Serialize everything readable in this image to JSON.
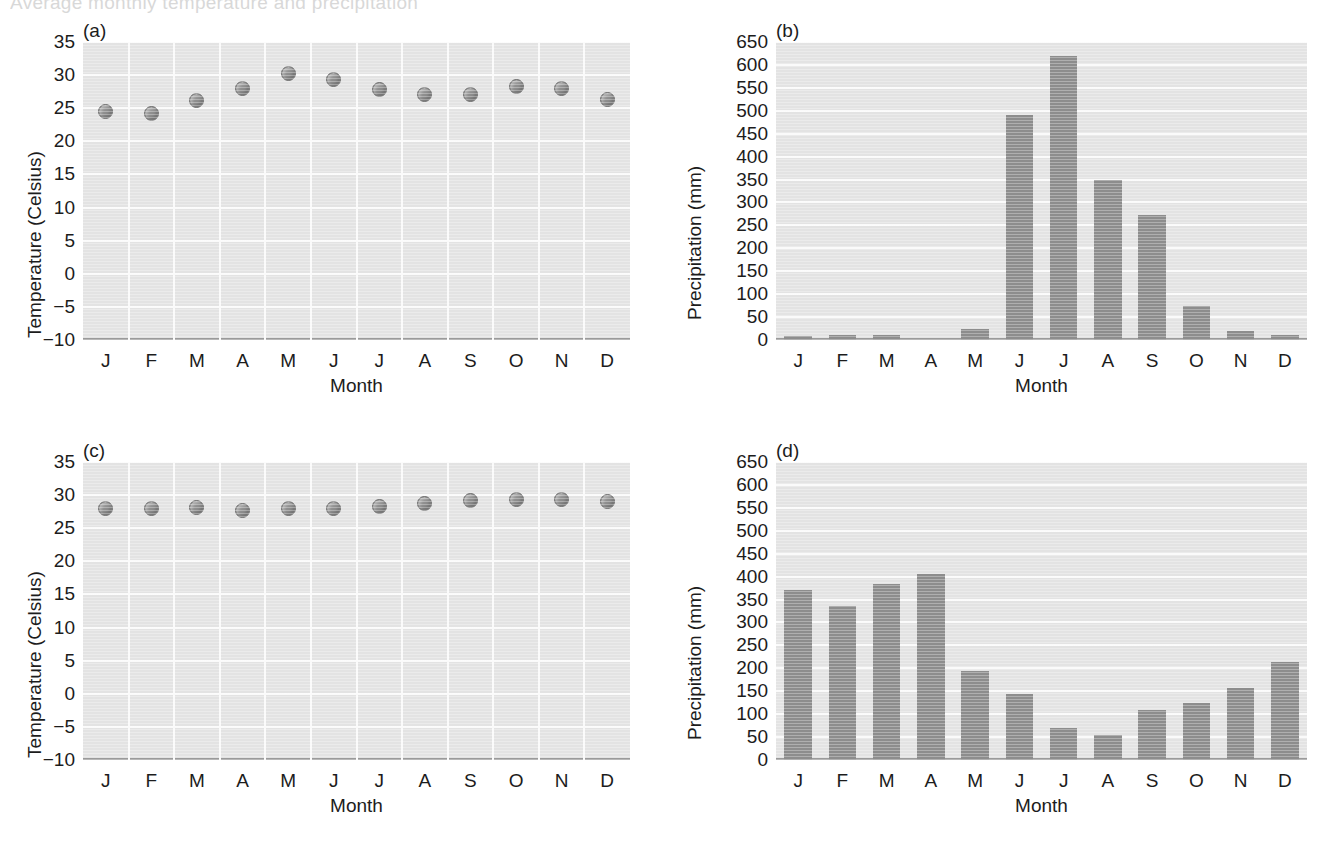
{
  "scan": {
    "top_clipped_text": "Average monthly temperature and precipitation"
  },
  "figure": {
    "panels": [
      "(a)",
      "(b)",
      "(c)",
      "(d)"
    ]
  },
  "axes": {
    "temperature_label": "Temperature (Celsius)",
    "precipitation_label": "Precipitation (mm)",
    "month_label": "Month",
    "month_ticks": [
      "J",
      "F",
      "M",
      "A",
      "M",
      "J",
      "J",
      "A",
      "S",
      "O",
      "N",
      "D"
    ],
    "temperature_ticks": [
      "35",
      "30",
      "25",
      "20",
      "15",
      "10",
      "5",
      "0",
      "−5",
      "−10"
    ],
    "precipitation_ticks": [
      "650",
      "600",
      "550",
      "500",
      "450",
      "400",
      "350",
      "300",
      "250",
      "200",
      "150",
      "100",
      "50",
      "0"
    ]
  },
  "colors": {
    "plot_background": "#e3e3e3",
    "gridline": "#fafafa",
    "marker_fill": "#8e8e8e",
    "marker_edge": "#6e6e6e",
    "bar_fill": "#8d8d8d",
    "axis_line": "#9a9a9a",
    "text": "#1c1c1c"
  },
  "chart_data": [
    {
      "type": "scatter",
      "panel": "(a)",
      "title": "",
      "xlabel": "Month",
      "ylabel": "Temperature (Celsius)",
      "categories": [
        "J",
        "F",
        "M",
        "A",
        "M",
        "J",
        "J",
        "A",
        "S",
        "O",
        "N",
        "D"
      ],
      "values": [
        24.5,
        24.2,
        26.2,
        28.0,
        30.2,
        29.3,
        27.8,
        27.1,
        27.1,
        28.3,
        28.0,
        26.3
      ],
      "ylim": [
        -10,
        35
      ],
      "ytick_step": 5,
      "grid": true,
      "legend": "none"
    },
    {
      "type": "bar",
      "panel": "(b)",
      "title": "",
      "xlabel": "Month",
      "ylabel": "Precipitation (mm)",
      "categories": [
        "J",
        "F",
        "M",
        "A",
        "M",
        "J",
        "J",
        "A",
        "S",
        "O",
        "N",
        "D"
      ],
      "values": [
        8,
        10,
        10,
        0,
        25,
        490,
        620,
        350,
        272,
        75,
        20,
        12
      ],
      "ylim": [
        0,
        650
      ],
      "ytick_step": 50,
      "grid": true,
      "legend": "none"
    },
    {
      "type": "scatter",
      "panel": "(c)",
      "title": "",
      "xlabel": "Month",
      "ylabel": "Temperature (Celsius)",
      "categories": [
        "J",
        "F",
        "M",
        "A",
        "M",
        "J",
        "J",
        "A",
        "S",
        "O",
        "N",
        "D"
      ],
      "values": [
        28.0,
        28.0,
        28.2,
        27.7,
        28.0,
        28.0,
        28.3,
        28.8,
        29.2,
        29.3,
        29.4,
        29.0
      ],
      "ylim": [
        -10,
        35
      ],
      "ytick_step": 5,
      "grid": true,
      "legend": "none"
    },
    {
      "type": "bar",
      "panel": "(d)",
      "title": "",
      "xlabel": "Month",
      "ylabel": "Precipitation (mm)",
      "categories": [
        "J",
        "F",
        "M",
        "A",
        "M",
        "J",
        "J",
        "A",
        "S",
        "O",
        "N",
        "D"
      ],
      "values": [
        370,
        335,
        385,
        405,
        195,
        145,
        70,
        55,
        110,
        125,
        158,
        213
      ],
      "ylim": [
        0,
        650
      ],
      "ytick_step": 50,
      "grid": true,
      "legend": "none"
    }
  ]
}
